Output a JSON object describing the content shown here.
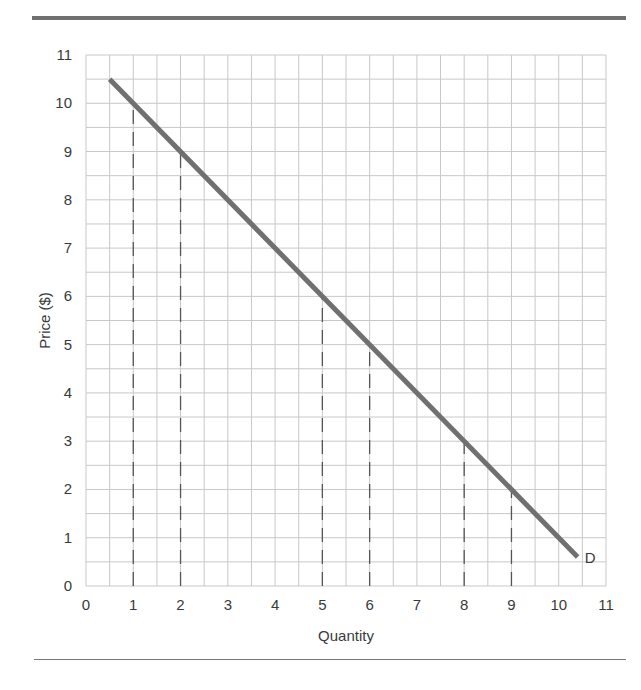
{
  "chart_data": {
    "type": "line",
    "title": "",
    "xlabel": "Quantity",
    "ylabel": "Price ($)",
    "xlim": [
      0,
      11
    ],
    "ylim": [
      0,
      11
    ],
    "x_ticks": [
      0,
      1,
      2,
      3,
      4,
      5,
      6,
      7,
      8,
      9,
      10,
      11
    ],
    "y_ticks": [
      0,
      1,
      2,
      3,
      4,
      5,
      6,
      7,
      8,
      9,
      10,
      11
    ],
    "grid": true,
    "grid_step": 0.5,
    "series": [
      {
        "name": "D",
        "label": "D",
        "points": [
          [
            0.5,
            10.5
          ],
          [
            10.4,
            0.6
          ]
        ],
        "equation": "P = 11 - Q",
        "color": "#707070"
      }
    ],
    "reference_lines": [
      {
        "x": 1,
        "y": 10,
        "style": "dashed"
      },
      {
        "x": 2,
        "y": 9,
        "style": "dashed"
      },
      {
        "x": 5,
        "y": 6,
        "style": "dashed"
      },
      {
        "x": 6,
        "y": 5,
        "style": "dashed"
      },
      {
        "x": 8,
        "y": 3,
        "style": "dashed"
      },
      {
        "x": 9,
        "y": 2,
        "style": "dashed"
      }
    ],
    "legend": "inline label 'D' at end of line"
  },
  "labels": {
    "xlabel": "Quantity",
    "ylabel": "Price ($)",
    "curve": "D"
  }
}
